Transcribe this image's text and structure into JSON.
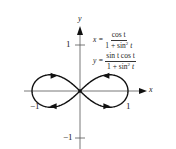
{
  "chart_data": {
    "type": "line",
    "title": "",
    "curve": "parametric lemniscate (figure-eight)",
    "equations": {
      "x": {
        "lhs": "x =",
        "numerator": "cos t",
        "denominator": "1 + sin² t"
      },
      "y": {
        "lhs": "y =",
        "numerator": "sin t cos t",
        "denominator": "1 + sin² t"
      }
    },
    "xlabel": "x",
    "ylabel": "y",
    "xlim": [
      -1.05,
      1.4
    ],
    "ylim": [
      -1.3,
      1.3
    ],
    "x_ticks": [
      {
        "value": -1,
        "label": "−1"
      },
      {
        "value": 1,
        "label": "1"
      }
    ],
    "y_ticks": [
      {
        "value": 1,
        "label": "1"
      },
      {
        "value": -1,
        "label": "−1"
      }
    ],
    "grid": false,
    "legend": "none",
    "direction_arrows": [
      {
        "x": 0.55,
        "y": 0.33,
        "dir": "left"
      },
      {
        "x": -0.55,
        "y": 0.33,
        "dir": "right"
      },
      {
        "x": -0.55,
        "y": -0.33,
        "dir": "left"
      },
      {
        "x": 0.55,
        "y": -0.33,
        "dir": "right"
      }
    ],
    "sample_points": [
      {
        "t": 0,
        "x": 1.0,
        "y": 0.0
      },
      {
        "t": 0.524,
        "x": 0.693,
        "y": 0.346
      },
      {
        "t": 0.785,
        "x": 0.471,
        "y": 0.333
      },
      {
        "t": 1.047,
        "x": 0.286,
        "y": 0.247
      },
      {
        "t": 1.571,
        "x": 0.0,
        "y": 0.0
      },
      {
        "t": 2.094,
        "x": -0.286,
        "y": -0.247
      },
      {
        "t": 2.356,
        "x": -0.471,
        "y": -0.333
      },
      {
        "t": 2.618,
        "x": -0.693,
        "y": -0.346
      },
      {
        "t": 3.142,
        "x": -1.0,
        "y": 0.0
      }
    ]
  },
  "axes": {
    "x_label": "x",
    "y_label": "y",
    "tick_x_neg": "−1",
    "tick_x_pos": "1",
    "tick_y_pos": "1",
    "tick_y_neg": "−1"
  },
  "equations": {
    "x_lhs": "x =",
    "x_num": "cos t",
    "x_den": "1 + sin",
    "x_den_exp": "2",
    "x_den_tail": " t",
    "y_lhs": "y =",
    "y_num": "sin t cos t",
    "y_den": "1 + sin",
    "y_den_exp": "2",
    "y_den_tail": " t"
  }
}
